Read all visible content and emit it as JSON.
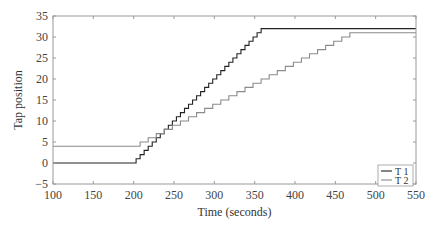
{
  "chart_data": {
    "type": "line",
    "title": "",
    "xlabel": "Time (seconds)",
    "ylabel": "Tap position",
    "xlim": [
      100,
      550
    ],
    "ylim": [
      -5,
      35
    ],
    "xticks": [
      100,
      150,
      200,
      250,
      300,
      350,
      400,
      450,
      500,
      550
    ],
    "yticks": [
      -5,
      0,
      5,
      10,
      15,
      20,
      25,
      30,
      35
    ],
    "xtick_labels": [
      "100",
      "150",
      "200",
      "250",
      "300",
      "350",
      "400",
      "450",
      "500",
      "550"
    ],
    "ytick_labels": [
      "−5",
      "0",
      "5",
      "10",
      "15",
      "20",
      "25",
      "30",
      "35"
    ],
    "grid": false,
    "legend_position": "bottom-right",
    "series": [
      {
        "name": "T 1",
        "color": "#222222",
        "style": "step",
        "initial_value": 0,
        "start_time": 203,
        "step_interval": 5,
        "step_size": 1,
        "final_value": 32,
        "end_time": 550
      },
      {
        "name": "T 2",
        "color": "#8a8a8a",
        "style": "step",
        "initial_value": 4,
        "start_time": 208,
        "step_interval": 10,
        "step_size": 1,
        "final_value": 31,
        "end_time": 550
      }
    ]
  }
}
